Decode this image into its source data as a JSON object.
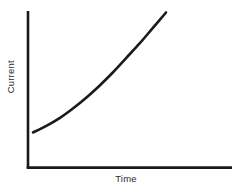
{
  "chart_data": {
    "type": "line",
    "title": "",
    "subtitle": "",
    "xlabel": "Time",
    "ylabel": "Current",
    "xticklabels": [],
    "yticklabels": [],
    "grid": false,
    "legend": false,
    "legend_position": "none",
    "xlim": [
      0,
      1
    ],
    "ylim": [
      0,
      1
    ],
    "annotations": [],
    "series": [
      {
        "name": "Current vs Time",
        "shape": "exponential growth",
        "color": "#1a1a1a",
        "x": [
          0.0,
          0.1,
          0.2,
          0.3,
          0.4,
          0.5,
          0.6,
          0.7,
          0.8,
          0.9,
          1.0
        ],
        "y": [
          0.0,
          0.055,
          0.12,
          0.2,
          0.29,
          0.39,
          0.5,
          0.62,
          0.74,
          0.87,
          1.0
        ]
      }
    ]
  },
  "axes": {
    "axis_color": "#1a1a1a",
    "curve_color": "#1a1a1a",
    "background": "#ffffff"
  },
  "labels": {
    "y_axis": "Current",
    "x_axis": "Time"
  }
}
